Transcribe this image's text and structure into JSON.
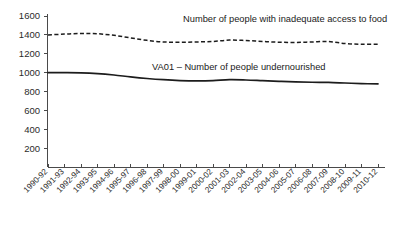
{
  "chart_data": {
    "type": "line",
    "title": "",
    "subtitle": "",
    "xlabel": "",
    "ylabel": "",
    "grid": false,
    "legend_position": "inline-annotation",
    "xlim_categories": [
      "1990-92",
      "2010-12"
    ],
    "ylim": [
      0,
      1600
    ],
    "y_ticks": [
      200,
      400,
      600,
      800,
      1000,
      1200,
      1400,
      1600
    ],
    "categories": [
      "1990-92",
      "1991-93",
      "1992-94",
      "1993-95",
      "1994-96",
      "1995-97",
      "1996-98",
      "1997-99",
      "1998-00",
      "1999-01",
      "2000-02",
      "2001-03",
      "2002-04",
      "2003-05",
      "2004-06",
      "2005-07",
      "2006-08",
      "2007-09",
      "2008-10",
      "2009-11",
      "2010-12"
    ],
    "series": [
      {
        "name": "Number of people with inadequate access to food",
        "style": "dashed",
        "annotation": "Number of people with inadequate access to food",
        "values": [
          1400,
          1408,
          1415,
          1412,
          1395,
          1368,
          1342,
          1325,
          1322,
          1325,
          1330,
          1345,
          1340,
          1330,
          1322,
          1320,
          1325,
          1330,
          1308,
          1300,
          1302
        ]
      },
      {
        "name": "VA01 - Number of people undernourished",
        "style": "solid",
        "annotation": "VA01 – Number of people undernourished",
        "values": [
          1000,
          1000,
          998,
          990,
          975,
          955,
          938,
          925,
          916,
          912,
          915,
          925,
          922,
          915,
          908,
          902,
          898,
          896,
          890,
          884,
          880
        ]
      }
    ]
  },
  "axes": {
    "y_tick_labels": [
      "1600",
      "1400",
      "1200",
      "1000",
      "800",
      "600",
      "400",
      "200"
    ],
    "x_tick_labels": [
      "1990-92",
      "1991-93",
      "1992-94",
      "1993-95",
      "1994-96",
      "1995-97",
      "1996-98",
      "1997-99",
      "1998-00",
      "1999-01",
      "2000-02",
      "2001-03",
      "2002-04",
      "2003-05",
      "2004-06",
      "2005-07",
      "2006-08",
      "2007-09",
      "2008-10",
      "2009-11",
      "2010-12"
    ]
  },
  "annotations": {
    "dashed_series_label": "Number of people with inadequate access to food",
    "solid_series_label": "VA01 – Number of people undernourished"
  },
  "colors": {
    "line": "#1c1c1c",
    "axis": "#4a4a4a",
    "text": "#2b2b2b",
    "background": "#ffffff"
  }
}
